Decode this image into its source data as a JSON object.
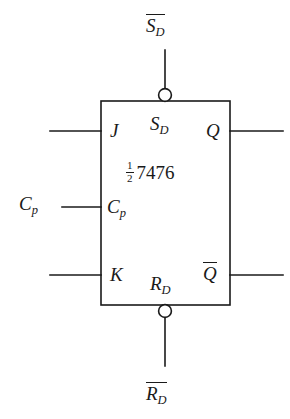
{
  "diagram": {
    "type": "logic-symbol",
    "device": {
      "fraction_numerator": "1",
      "fraction_denominator": "2",
      "part_number": "7476",
      "description": "1/2 7476"
    },
    "external_labels": {
      "set_direct": {
        "base": "S",
        "subscript": "D",
        "overline": true,
        "text": "S̅D̅"
      },
      "reset_direct": {
        "base": "R",
        "subscript": "D",
        "overline": true,
        "text": "R̅D̅"
      },
      "clock": {
        "base": "C",
        "subscript": "p",
        "overline": false,
        "text": "Cp"
      }
    },
    "pins": {
      "j_input": {
        "base": "J",
        "subscript": "",
        "overline": false,
        "text": "J"
      },
      "set_direct_pin": {
        "base": "S",
        "subscript": "D",
        "overline": false,
        "text": "SD"
      },
      "q_output": {
        "base": "Q",
        "subscript": "",
        "overline": false,
        "text": "Q"
      },
      "clock_pin": {
        "base": "C",
        "subscript": "p",
        "overline": false,
        "text": "Cp"
      },
      "k_input": {
        "base": "K",
        "subscript": "",
        "overline": false,
        "text": "K"
      },
      "reset_direct_pin": {
        "base": "R",
        "subscript": "D",
        "overline": false,
        "text": "RD"
      },
      "q_bar_output": {
        "base": "Q",
        "subscript": "",
        "overline": true,
        "text": "Q̅"
      }
    },
    "colors": {
      "line": "#1a1a1a",
      "background": "#ffffff",
      "bubble_fill": "#ffffff"
    },
    "geometry": {
      "box": {
        "x": 101,
        "y": 101,
        "width": 129,
        "height": 204
      },
      "bubbles": [
        {
          "name": "set-bubble",
          "cx": 165,
          "cy": 95,
          "r": 6.5
        },
        {
          "name": "reset-bubble",
          "cx": 165,
          "cy": 311,
          "r": 6.5
        }
      ],
      "rows": {
        "top": 131,
        "clock": 207,
        "bottom": 275
      }
    }
  }
}
